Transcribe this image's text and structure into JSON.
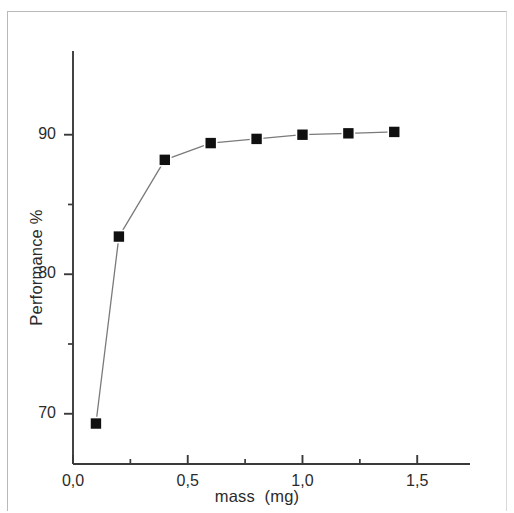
{
  "figure": {
    "background_color": "#ffffff",
    "frame_color": "#b9b9b9",
    "axis_color": "#3a3a3a",
    "marker_color": "#101010",
    "line_color": "#7a7a7a"
  },
  "chart_data": {
    "type": "line",
    "title": "",
    "subtitle": "",
    "xlabel": "mass  (mg)",
    "ylabel": "Performance %",
    "xlim": [
      0.0,
      1.73
    ],
    "ylim": [
      66.4,
      96.0
    ],
    "grid": false,
    "legend": null,
    "x_tick_labels": [
      "0,0",
      "0,5",
      "1,0",
      "1,5"
    ],
    "x_tick_values": [
      0.0,
      0.5,
      1.0,
      1.5
    ],
    "x_minor_tick_values": [
      0.25,
      0.75,
      1.25
    ],
    "y_tick_labels": [
      "70",
      "80",
      "90"
    ],
    "y_tick_values": [
      70,
      80,
      90
    ],
    "y_minor_tick_values": [
      75,
      85
    ],
    "series": [
      {
        "name": "Performance vs mass",
        "marker": "filled-square",
        "x": [
          0.1,
          0.2,
          0.4,
          0.6,
          0.8,
          1.0,
          1.2,
          1.4
        ],
        "values": [
          69.3,
          82.7,
          88.2,
          89.4,
          89.7,
          90.0,
          90.1,
          90.2
        ]
      }
    ]
  }
}
